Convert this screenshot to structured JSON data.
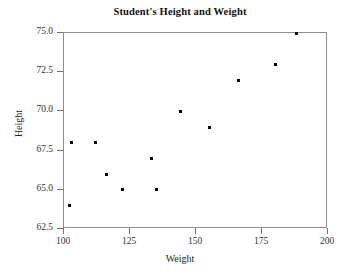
{
  "chart_data": {
    "type": "scatter",
    "title": "Student's Height and Weight",
    "xlabel": "Weight",
    "ylabel": "Height",
    "xlim": [
      100,
      200
    ],
    "ylim": [
      62.5,
      75.0
    ],
    "grid": false,
    "legend": null,
    "xticks": [
      "100",
      "125",
      "150",
      "175",
      "200"
    ],
    "xtick_values": [
      100,
      125,
      150,
      175,
      200
    ],
    "yticks": [
      "62.5",
      "65.0",
      "67.5",
      "70.0",
      "72.5",
      "75.0"
    ],
    "ytick_values": [
      62.5,
      65.0,
      67.5,
      70.0,
      72.5,
      75.0
    ],
    "marker": "square",
    "marker_color": "#000000",
    "points": [
      {
        "x": 102,
        "y": 64.0
      },
      {
        "x": 103,
        "y": 68.0
      },
      {
        "x": 112,
        "y": 68.0
      },
      {
        "x": 116,
        "y": 66.0
      },
      {
        "x": 122,
        "y": 65.0
      },
      {
        "x": 133,
        "y": 67.0
      },
      {
        "x": 135,
        "y": 65.0
      },
      {
        "x": 144,
        "y": 70.0
      },
      {
        "x": 155,
        "y": 69.0
      },
      {
        "x": 166,
        "y": 72.0
      },
      {
        "x": 180,
        "y": 73.0
      },
      {
        "x": 188,
        "y": 75.0
      }
    ]
  },
  "style": {
    "frame_color": "#8d8d8d",
    "tick_color": "#6f6f6f",
    "text_color": "#222222",
    "background": "#ffffff"
  }
}
